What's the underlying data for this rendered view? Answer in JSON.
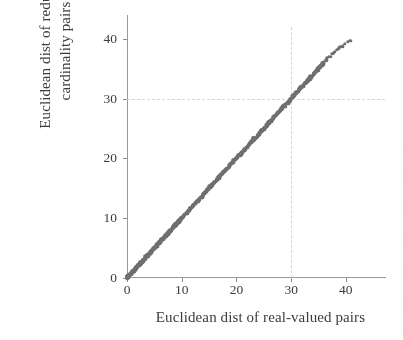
{
  "chart_data": {
    "type": "scatter",
    "title": "",
    "xlabel": "Euclidean dist of real-valued pairs",
    "ylabel_line1": "Euclidean dist of reduced",
    "ylabel_line2": "cardinality pairs",
    "xlim": [
      0,
      43.5
    ],
    "ylim": [
      0,
      42
    ],
    "xticks": [
      0,
      10,
      20,
      30,
      40
    ],
    "yticks": [
      0,
      10,
      20,
      30,
      40
    ],
    "xticklabels": [
      "0",
      "10",
      "20",
      "30",
      "40"
    ],
    "yticklabels": [
      "0",
      "10",
      "20",
      "30",
      "40"
    ],
    "grid": true,
    "gridlines_x": [
      30
    ],
    "gridlines_y": [
      30
    ],
    "legend": null,
    "legend_position": "none",
    "marker_color": "#6f6f6f",
    "axis_color": "#9a9a9a",
    "text_color": "#3c3c3c",
    "grid_color": "#d5d5d5",
    "relationship": "y = x (near-perfect identity, dense band of points along the diagonal)",
    "n_points": 420,
    "x": [
      0.0,
      0.1,
      0.2,
      0.3,
      0.4,
      0.5,
      0.6,
      0.7,
      0.8,
      0.9,
      1.0,
      1.1,
      1.2,
      1.3,
      1.4,
      1.5,
      1.6,
      1.7,
      1.8,
      1.9,
      2.0,
      2.1,
      2.2,
      2.3,
      2.4,
      2.5,
      2.6,
      2.7,
      2.8,
      2.9,
      3.0,
      3.1,
      3.2,
      3.3,
      3.4,
      3.5,
      3.6,
      3.7,
      3.8,
      3.9,
      4.0,
      4.1,
      4.2,
      4.3,
      4.4,
      4.5,
      4.6,
      4.7,
      4.8,
      4.9,
      5.0,
      5.1,
      5.2,
      5.3,
      5.4,
      5.5,
      5.6,
      5.7,
      5.8,
      5.9,
      6.0,
      6.1,
      6.2,
      6.3,
      6.4,
      6.5,
      6.6,
      6.7,
      6.8,
      6.9,
      7.0,
      7.1,
      7.2,
      7.3,
      7.4,
      7.5,
      7.6,
      7.7,
      7.8,
      7.9,
      8.0,
      8.1,
      8.2,
      8.3,
      8.4,
      8.5,
      8.6,
      8.7,
      8.8,
      8.9,
      9.0,
      9.1,
      9.2,
      9.3,
      9.4,
      9.5,
      9.6,
      9.7,
      9.8,
      9.9,
      10.0,
      10.2,
      10.4,
      10.6,
      10.8,
      11.0,
      11.2,
      11.4,
      11.6,
      11.8,
      12.0,
      12.2,
      12.4,
      12.6,
      12.8,
      13.0,
      13.2,
      13.4,
      13.6,
      13.8,
      14.0,
      14.2,
      14.4,
      14.6,
      14.8,
      15.0,
      15.2,
      15.4,
      15.6,
      15.8,
      16.0,
      16.2,
      16.4,
      16.6,
      16.8,
      17.0,
      17.2,
      17.4,
      17.6,
      17.8,
      18.0,
      18.2,
      18.4,
      18.6,
      18.8,
      19.0,
      19.2,
      19.4,
      19.6,
      19.8,
      20.0,
      20.2,
      20.4,
      20.6,
      20.8,
      21.0,
      21.2,
      21.4,
      21.6,
      21.8,
      22.0,
      22.2,
      22.4,
      22.6,
      22.8,
      23.0,
      23.2,
      23.4,
      23.6,
      23.8,
      24.0,
      24.2,
      24.4,
      24.6,
      24.8,
      25.0,
      25.2,
      25.4,
      25.6,
      25.8,
      26.0,
      26.2,
      26.4,
      26.6,
      26.8,
      27.0,
      27.2,
      27.4,
      27.6,
      27.8,
      28.0,
      28.2,
      28.4,
      28.6,
      28.8,
      29.0,
      29.2,
      29.4,
      29.6,
      29.8,
      30.0,
      30.2,
      30.4,
      30.6,
      30.8,
      31.0,
      31.2,
      31.4,
      31.6,
      31.8,
      32.0,
      32.2,
      32.4,
      32.6,
      32.8,
      33.0,
      33.2,
      33.4,
      33.6,
      33.8,
      34.0,
      34.2,
      34.4,
      34.6,
      34.8,
      35.0,
      35.2,
      35.4,
      35.6,
      35.8,
      36.0,
      36.3,
      36.6,
      36.9,
      37.2,
      37.5,
      37.8,
      38.1,
      38.4,
      38.7,
      39.0,
      39.4,
      39.9,
      40.4,
      40.9
    ],
    "y": [
      0.0,
      0.1,
      0.2,
      0.3,
      0.4,
      0.5,
      0.6,
      0.7,
      0.8,
      0.9,
      1.0,
      1.1,
      1.2,
      1.3,
      1.4,
      1.5,
      1.6,
      1.7,
      1.8,
      1.9,
      2.0,
      2.1,
      2.2,
      2.3,
      2.4,
      2.5,
      2.6,
      2.7,
      2.8,
      2.9,
      3.0,
      3.1,
      3.2,
      3.3,
      3.4,
      3.5,
      3.6,
      3.7,
      3.8,
      3.9,
      4.0,
      4.1,
      4.2,
      4.3,
      4.4,
      4.5,
      4.6,
      4.7,
      4.8,
      4.9,
      5.0,
      5.1,
      5.2,
      5.3,
      5.4,
      5.5,
      5.6,
      5.7,
      5.8,
      5.9,
      6.0,
      6.1,
      6.2,
      6.3,
      6.4,
      6.5,
      6.6,
      6.7,
      6.8,
      6.9,
      7.0,
      7.1,
      7.2,
      7.3,
      7.4,
      7.5,
      7.6,
      7.7,
      7.8,
      7.9,
      8.0,
      8.1,
      8.2,
      8.3,
      8.4,
      8.5,
      8.6,
      8.7,
      8.8,
      8.9,
      9.0,
      9.1,
      9.2,
      9.3,
      9.4,
      9.5,
      9.6,
      9.7,
      9.8,
      9.9,
      10.0,
      10.2,
      10.4,
      10.6,
      10.8,
      11.0,
      11.2,
      11.4,
      11.6,
      11.8,
      12.0,
      12.2,
      12.4,
      12.6,
      12.8,
      13.0,
      13.2,
      13.4,
      13.6,
      13.8,
      14.0,
      14.2,
      14.4,
      14.6,
      14.8,
      15.0,
      15.2,
      15.4,
      15.6,
      15.8,
      16.0,
      16.2,
      16.4,
      16.6,
      16.8,
      17.0,
      17.2,
      17.4,
      17.6,
      17.8,
      18.0,
      18.2,
      18.4,
      18.6,
      18.8,
      19.0,
      19.2,
      19.4,
      19.6,
      19.8,
      20.0,
      20.2,
      20.4,
      20.6,
      20.8,
      21.0,
      21.2,
      21.4,
      21.6,
      21.8,
      22.0,
      22.2,
      22.4,
      22.6,
      22.8,
      23.0,
      23.2,
      23.4,
      23.6,
      23.8,
      24.0,
      24.2,
      24.4,
      24.6,
      24.8,
      25.0,
      25.2,
      25.4,
      25.6,
      25.8,
      26.0,
      26.2,
      26.4,
      26.6,
      26.8,
      27.0,
      27.2,
      27.4,
      27.6,
      27.8,
      28.0,
      28.2,
      28.4,
      28.6,
      28.8,
      29.0,
      29.2,
      29.4,
      29.6,
      29.8,
      30.0,
      30.2,
      30.4,
      30.6,
      30.8,
      31.0,
      31.2,
      31.4,
      31.6,
      31.8,
      32.0,
      32.2,
      32.4,
      32.6,
      32.8,
      33.0,
      33.2,
      33.4,
      33.6,
      33.8,
      34.0,
      34.2,
      34.4,
      34.6,
      34.8,
      35.0,
      35.2,
      35.4,
      35.6,
      35.8,
      36.0,
      36.3,
      36.6,
      36.9,
      37.1,
      37.4,
      37.6,
      37.9,
      38.1,
      38.4,
      38.6,
      38.9,
      39.2,
      39.4,
      39.5
    ]
  }
}
